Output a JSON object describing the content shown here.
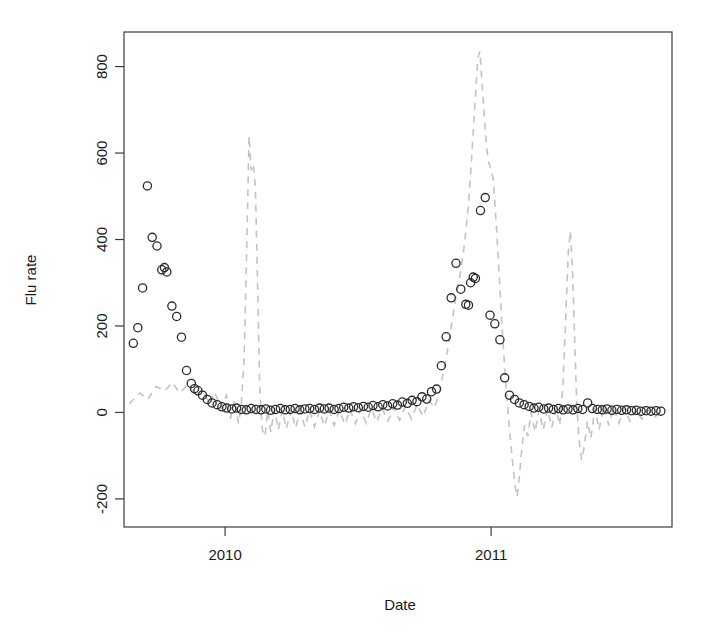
{
  "figure": {
    "title": "",
    "background": "#ffffff"
  },
  "axes": {
    "x_title": "Date",
    "y_title": "Flu rate",
    "x_ticks": [
      "2010",
      "2011"
    ],
    "y_ticks": [
      "-200",
      "0",
      "200",
      "400",
      "600",
      "800"
    ]
  },
  "colors": {
    "point_stroke": "#2b2b2b",
    "fit_line": "#c3c3c3",
    "frame": "#3b3b3b",
    "text": "#1a1a1a"
  },
  "chart_data": {
    "type": "scatter",
    "title": "",
    "xlabel": "Date",
    "ylabel": "Flu rate",
    "xlim": [
      2009.62,
      2011.68
    ],
    "ylim": [
      -265,
      880
    ],
    "grid": false,
    "legend": null,
    "x_tick_values": [
      2010,
      2011
    ],
    "x_tick_labels": [
      "2010",
      "2011"
    ],
    "y_tick_values": [
      -200,
      0,
      200,
      400,
      600,
      800
    ],
    "y_tick_labels": [
      "-200",
      "0",
      "200",
      "400",
      "600",
      "800"
    ],
    "series": [
      {
        "name": "Observed flu rate",
        "type": "scatter",
        "marker": "open-circle",
        "color": "#2b2b2b",
        "points": [
          [
            2009.655,
            160
          ],
          [
            2009.672,
            196
          ],
          [
            2009.69,
            288
          ],
          [
            2009.708,
            524
          ],
          [
            2009.726,
            405
          ],
          [
            2009.744,
            385
          ],
          [
            2009.762,
            330
          ],
          [
            2009.772,
            335
          ],
          [
            2009.781,
            325
          ],
          [
            2009.8,
            246
          ],
          [
            2009.818,
            222
          ],
          [
            2009.836,
            174
          ],
          [
            2009.855,
            97
          ],
          [
            2009.873,
            67
          ],
          [
            2009.885,
            55
          ],
          [
            2009.898,
            50
          ],
          [
            2009.915,
            40
          ],
          [
            2009.933,
            30
          ],
          [
            2009.951,
            22
          ],
          [
            2009.97,
            18
          ],
          [
            2009.988,
            13
          ],
          [
            2010.006,
            10
          ],
          [
            2010.025,
            8
          ],
          [
            2010.043,
            10
          ],
          [
            2010.061,
            7
          ],
          [
            2010.08,
            6
          ],
          [
            2010.098,
            9
          ],
          [
            2010.116,
            7
          ],
          [
            2010.135,
            6
          ],
          [
            2010.153,
            8
          ],
          [
            2010.171,
            5
          ],
          [
            2010.19,
            7
          ],
          [
            2010.208,
            9
          ],
          [
            2010.226,
            6
          ],
          [
            2010.245,
            7
          ],
          [
            2010.263,
            9
          ],
          [
            2010.281,
            6
          ],
          [
            2010.3,
            8
          ],
          [
            2010.318,
            9
          ],
          [
            2010.336,
            7
          ],
          [
            2010.355,
            10
          ],
          [
            2010.373,
            8
          ],
          [
            2010.391,
            10
          ],
          [
            2010.41,
            7
          ],
          [
            2010.428,
            9
          ],
          [
            2010.446,
            12
          ],
          [
            2010.465,
            10
          ],
          [
            2010.483,
            13
          ],
          [
            2010.501,
            11
          ],
          [
            2010.52,
            14
          ],
          [
            2010.538,
            12
          ],
          [
            2010.556,
            16
          ],
          [
            2010.575,
            13
          ],
          [
            2010.593,
            18
          ],
          [
            2010.611,
            15
          ],
          [
            2010.63,
            20
          ],
          [
            2010.648,
            17
          ],
          [
            2010.666,
            24
          ],
          [
            2010.685,
            21
          ],
          [
            2010.703,
            28
          ],
          [
            2010.721,
            25
          ],
          [
            2010.74,
            36
          ],
          [
            2010.758,
            31
          ],
          [
            2010.776,
            48
          ],
          [
            2010.795,
            54
          ],
          [
            2010.813,
            108
          ],
          [
            2010.831,
            175
          ],
          [
            2010.85,
            265
          ],
          [
            2010.868,
            345
          ],
          [
            2010.886,
            285
          ],
          [
            2010.905,
            250
          ],
          [
            2010.915,
            248
          ],
          [
            2010.923,
            300
          ],
          [
            2010.933,
            313
          ],
          [
            2010.941,
            310
          ],
          [
            2010.96,
            467
          ],
          [
            2010.978,
            497
          ],
          [
            2010.996,
            225
          ],
          [
            2011.014,
            205
          ],
          [
            2011.033,
            168
          ],
          [
            2011.051,
            80
          ],
          [
            2011.069,
            40
          ],
          [
            2011.088,
            30
          ],
          [
            2011.106,
            22
          ],
          [
            2011.124,
            18
          ],
          [
            2011.143,
            14
          ],
          [
            2011.161,
            10
          ],
          [
            2011.179,
            12
          ],
          [
            2011.198,
            8
          ],
          [
            2011.216,
            10
          ],
          [
            2011.234,
            7
          ],
          [
            2011.253,
            9
          ],
          [
            2011.271,
            6
          ],
          [
            2011.289,
            8
          ],
          [
            2011.308,
            6
          ],
          [
            2011.326,
            9
          ],
          [
            2011.344,
            7
          ],
          [
            2011.363,
            22
          ],
          [
            2011.381,
            9
          ],
          [
            2011.399,
            7
          ],
          [
            2011.418,
            6
          ],
          [
            2011.436,
            8
          ],
          [
            2011.454,
            5
          ],
          [
            2011.473,
            7
          ],
          [
            2011.491,
            5
          ],
          [
            2011.509,
            6
          ],
          [
            2011.528,
            4
          ],
          [
            2011.546,
            5
          ],
          [
            2011.564,
            3
          ],
          [
            2011.583,
            4
          ],
          [
            2011.601,
            3
          ],
          [
            2011.62,
            4
          ],
          [
            2011.638,
            3
          ]
        ]
      },
      {
        "name": "Model fit",
        "type": "line",
        "style": "dashed",
        "color": "#c3c3c3",
        "points": [
          [
            2009.64,
            20
          ],
          [
            2009.68,
            45
          ],
          [
            2009.71,
            30
          ],
          [
            2009.74,
            60
          ],
          [
            2009.775,
            50
          ],
          [
            2009.8,
            70
          ],
          [
            2009.83,
            45
          ],
          [
            2009.86,
            65
          ],
          [
            2009.89,
            38
          ],
          [
            2009.915,
            55
          ],
          [
            2009.94,
            20
          ],
          [
            2009.96,
            48
          ],
          [
            2009.985,
            10
          ],
          [
            2010.005,
            40
          ],
          [
            2010.02,
            -15
          ],
          [
            2010.035,
            30
          ],
          [
            2010.05,
            -25
          ],
          [
            2010.06,
            10
          ],
          [
            2010.072,
            130
          ],
          [
            2010.082,
            400
          ],
          [
            2010.09,
            640
          ],
          [
            2010.098,
            560
          ],
          [
            2010.106,
            575
          ],
          [
            2010.114,
            520
          ],
          [
            2010.122,
            300
          ],
          [
            2010.13,
            60
          ],
          [
            2010.14,
            -40
          ],
          [
            2010.15,
            -55
          ],
          [
            2010.16,
            5
          ],
          [
            2010.172,
            -45
          ],
          [
            2010.185,
            8
          ],
          [
            2010.2,
            -40
          ],
          [
            2010.215,
            5
          ],
          [
            2010.23,
            -38
          ],
          [
            2010.248,
            6
          ],
          [
            2010.265,
            -36
          ],
          [
            2010.282,
            4
          ],
          [
            2010.3,
            -34
          ],
          [
            2010.318,
            5
          ],
          [
            2010.336,
            -33
          ],
          [
            2010.355,
            4
          ],
          [
            2010.373,
            -32
          ],
          [
            2010.392,
            5
          ],
          [
            2010.41,
            -30
          ],
          [
            2010.43,
            6
          ],
          [
            2010.45,
            -28
          ],
          [
            2010.47,
            7
          ],
          [
            2010.49,
            -26
          ],
          [
            2010.51,
            8
          ],
          [
            2010.53,
            -25
          ],
          [
            2010.55,
            9
          ],
          [
            2010.57,
            -22
          ],
          [
            2010.59,
            10
          ],
          [
            2010.612,
            -20
          ],
          [
            2010.634,
            12
          ],
          [
            2010.656,
            -18
          ],
          [
            2010.678,
            14
          ],
          [
            2010.7,
            -14
          ],
          [
            2010.722,
            18
          ],
          [
            2010.744,
            -10
          ],
          [
            2010.766,
            28
          ],
          [
            2010.788,
            10
          ],
          [
            2010.81,
            60
          ],
          [
            2010.83,
            120
          ],
          [
            2010.848,
            190
          ],
          [
            2010.866,
            260
          ],
          [
            2010.884,
            320
          ],
          [
            2010.9,
            390
          ],
          [
            2010.915,
            480
          ],
          [
            2010.928,
            600
          ],
          [
            2010.94,
            720
          ],
          [
            2010.95,
            820
          ],
          [
            2010.958,
            835
          ],
          [
            2010.966,
            760
          ],
          [
            2010.974,
            690
          ],
          [
            2010.982,
            620
          ],
          [
            2010.99,
            580
          ],
          [
            2010.998,
            565
          ],
          [
            2011.008,
            540
          ],
          [
            2011.02,
            430
          ],
          [
            2011.032,
            300
          ],
          [
            2011.044,
            170
          ],
          [
            2011.056,
            60
          ],
          [
            2011.068,
            -30
          ],
          [
            2011.08,
            -110
          ],
          [
            2011.09,
            -170
          ],
          [
            2011.098,
            -195
          ],
          [
            2011.106,
            -150
          ],
          [
            2011.116,
            -80
          ],
          [
            2011.126,
            -30
          ],
          [
            2011.138,
            -55
          ],
          [
            2011.15,
            0
          ],
          [
            2011.165,
            -45
          ],
          [
            2011.18,
            5
          ],
          [
            2011.196,
            -40
          ],
          [
            2011.212,
            8
          ],
          [
            2011.228,
            -35
          ],
          [
            2011.244,
            10
          ],
          [
            2011.258,
            -30
          ],
          [
            2011.27,
            60
          ],
          [
            2011.28,
            210
          ],
          [
            2011.29,
            370
          ],
          [
            2011.298,
            420
          ],
          [
            2011.306,
            330
          ],
          [
            2011.314,
            170
          ],
          [
            2011.322,
            20
          ],
          [
            2011.33,
            -60
          ],
          [
            2011.34,
            -110
          ],
          [
            2011.35,
            -80
          ],
          [
            2011.362,
            -20
          ],
          [
            2011.375,
            -60
          ],
          [
            2011.39,
            10
          ],
          [
            2011.406,
            -40
          ],
          [
            2011.424,
            15
          ],
          [
            2011.442,
            -30
          ],
          [
            2011.46,
            12
          ],
          [
            2011.48,
            -25
          ],
          [
            2011.5,
            10
          ],
          [
            2011.522,
            -20
          ],
          [
            2011.544,
            8
          ],
          [
            2011.566,
            -15
          ],
          [
            2011.59,
            6
          ],
          [
            2011.614,
            -12
          ],
          [
            2011.638,
            4
          ]
        ]
      }
    ]
  }
}
